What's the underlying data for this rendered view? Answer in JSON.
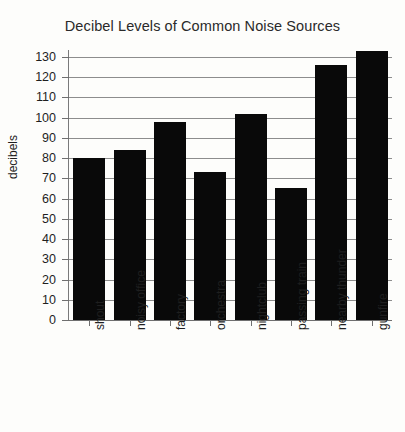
{
  "chart_data": {
    "type": "bar",
    "title": "Decibel Levels of Common Noise Sources",
    "xlabel": "",
    "ylabel": "decibels",
    "categories": [
      "shout",
      "noisy office",
      "factory",
      "orchestra",
      "nightclub",
      "passing train",
      "nearby thunder",
      "gunfire"
    ],
    "values": [
      80,
      84,
      98,
      73,
      102,
      65,
      126,
      133
    ],
    "ylim": [
      0,
      130
    ],
    "ytick_labels": [
      "130",
      "120",
      "110",
      "100",
      "90",
      "80",
      "70",
      "60",
      "50",
      "40",
      "30",
      "20",
      "10",
      "0"
    ],
    "ytick_values": [
      130,
      120,
      110,
      100,
      90,
      80,
      70,
      60,
      50,
      40,
      30,
      20,
      10,
      0
    ],
    "ytick_step": 10,
    "grid": "horizontal",
    "legend": "none",
    "bar_color": "#090909",
    "background_color": "#fdfdfb",
    "gridline_color": "#8d8d8d",
    "xtick_label_rotation": -90
  }
}
